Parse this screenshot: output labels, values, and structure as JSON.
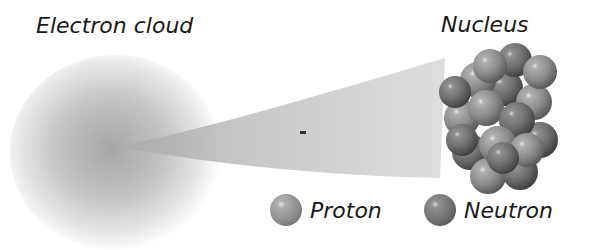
{
  "labels": {
    "electron_cloud": "Electron cloud",
    "nucleus": "Nucleus"
  },
  "legend": [
    {
      "name": "Proton",
      "color": "#8a8a8a"
    },
    {
      "name": "Neutron",
      "color": "#6c6c6c"
    }
  ],
  "colors": {
    "cloud": "#a8a8a8",
    "wedge": "#c4c4c4",
    "proton": "#8a8a8a",
    "neutron": "#6c6c6c"
  }
}
